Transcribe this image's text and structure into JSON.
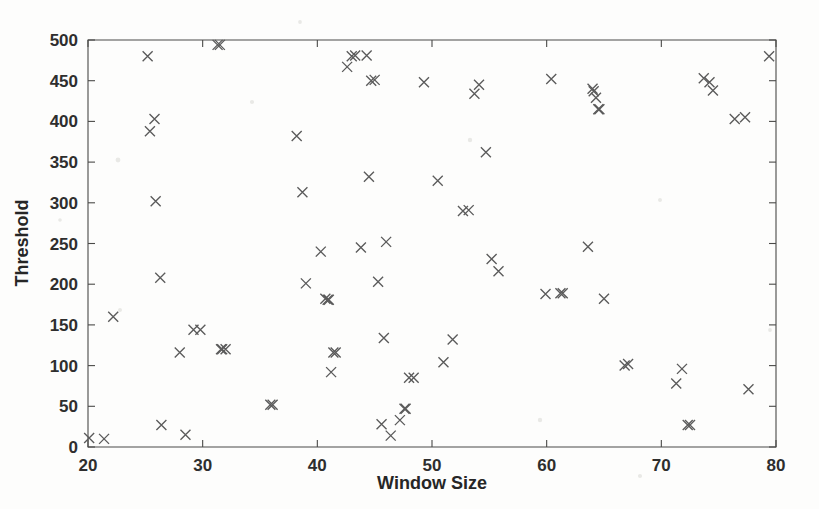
{
  "figure": {
    "background_color": "#fdfdfc",
    "marker_color": "#5b5b5b",
    "axis_color": "#4a4a48",
    "marker_symbol": "x",
    "marker_symbol_name": "cross-marker"
  },
  "chart_data": {
    "type": "scatter",
    "title": "",
    "xlabel": "Window Size",
    "ylabel": "Threshold",
    "xlim": [
      20,
      80
    ],
    "ylim": [
      0,
      500
    ],
    "xticks": [
      20,
      30,
      40,
      50,
      60,
      70,
      80
    ],
    "xtick_labels": [
      "20",
      "30",
      "40",
      "50",
      "60",
      "70",
      "80"
    ],
    "yticks": [
      0,
      50,
      100,
      150,
      200,
      250,
      300,
      350,
      400,
      450,
      500
    ],
    "ytick_labels": [
      "0",
      "50",
      "100",
      "150",
      "200",
      "250",
      "300",
      "350",
      "400",
      "450",
      "500"
    ],
    "grid": false,
    "legend": false,
    "legend_position": "none",
    "n_points": 76,
    "series": [
      {
        "name": "Threshold vs Window Size",
        "marker": "x",
        "x": [
          20.1,
          21.4,
          22.2,
          25.2,
          25.4,
          25.8,
          25.9,
          26.3,
          26.4,
          28.0,
          28.5,
          29.2,
          29.8,
          31.3,
          31.5,
          31.6,
          31.7,
          32.0,
          35.9,
          36.1,
          38.2,
          38.7,
          39.0,
          40.3,
          40.7,
          40.9,
          41.0,
          41.2,
          41.4,
          41.6,
          42.6,
          43.0,
          43.3,
          43.8,
          44.3,
          44.5,
          44.7,
          45.0,
          45.3,
          45.6,
          45.8,
          46.0,
          46.4,
          47.2,
          47.6,
          47.7,
          48.0,
          48.4,
          49.3,
          50.5,
          51.0,
          51.8,
          52.7,
          53.2,
          53.7,
          54.1,
          54.7,
          55.2,
          55.8,
          59.9,
          60.4,
          61.2,
          61.4,
          63.6,
          64.0,
          64.1,
          64.3,
          64.5,
          64.6,
          65.0,
          66.8,
          67.1,
          71.3,
          71.8,
          72.3,
          72.5,
          73.7,
          74.2,
          74.5,
          76.4,
          77.3,
          77.6,
          79.4
        ],
        "y": [
          11,
          10,
          160,
          480,
          388,
          403,
          302,
          208,
          27,
          116,
          15,
          144,
          144,
          494,
          494,
          120,
          120,
          120,
          52,
          52,
          382,
          313,
          201,
          240,
          182,
          181,
          181,
          92,
          116,
          116,
          467,
          480,
          481,
          245,
          481,
          332,
          450,
          451,
          203,
          28,
          134,
          252,
          14,
          33,
          47,
          47,
          85,
          85,
          448,
          327,
          104,
          132,
          290,
          291,
          434,
          445,
          362,
          231,
          216,
          188,
          452,
          189,
          189,
          246,
          440,
          437,
          429,
          415,
          415,
          182,
          100,
          102,
          78,
          96,
          27,
          27,
          453,
          448,
          438,
          403,
          405,
          71,
          480
        ]
      }
    ]
  },
  "axis_labels": {
    "x_title": "Window Size",
    "y_title": "Threshold"
  }
}
